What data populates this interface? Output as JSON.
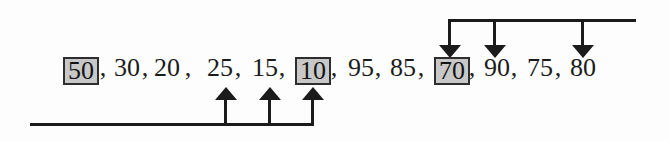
{
  "sequence": {
    "separator": ",",
    "items": [
      {
        "value": "50",
        "boxed": true
      },
      {
        "value": "30",
        "boxed": false
      },
      {
        "value": "20",
        "boxed": false
      },
      {
        "value": "25",
        "boxed": false
      },
      {
        "value": "15",
        "boxed": false
      },
      {
        "value": "10",
        "boxed": true
      },
      {
        "value": "95",
        "boxed": false
      },
      {
        "value": "85",
        "boxed": false
      },
      {
        "value": "70",
        "boxed": true
      },
      {
        "value": "90",
        "boxed": false
      },
      {
        "value": "75",
        "boxed": false
      },
      {
        "value": "80",
        "boxed": false
      }
    ]
  },
  "pointers": {
    "bottom_arrows_point_to": [
      "25",
      "15",
      "10"
    ],
    "top_arrows_point_to": [
      "70",
      "90",
      "80"
    ]
  },
  "colors": {
    "ink": "#1b1b1b",
    "box_fill": "#c8c8c8",
    "background": "#fdfdfd"
  }
}
